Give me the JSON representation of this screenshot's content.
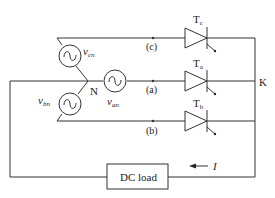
{
  "diagram": {
    "type": "three-phase half-wave controlled rectifier",
    "sources": {
      "phase_c": {
        "label": "v",
        "sub": "cn"
      },
      "phase_a": {
        "label": "v",
        "sub": "an"
      },
      "phase_b": {
        "label": "v",
        "sub": "bn"
      }
    },
    "neutral_label": "N",
    "nodes": {
      "c": "(c)",
      "a": "(a)",
      "b": "(b)"
    },
    "thyristors": {
      "tc": {
        "label": "T",
        "sub": "c"
      },
      "ta": {
        "label": "T",
        "sub": "a"
      },
      "tb": {
        "label": "T",
        "sub": "b"
      }
    },
    "cathode_label": "K",
    "load_label": "DC load",
    "current_label": "I"
  }
}
